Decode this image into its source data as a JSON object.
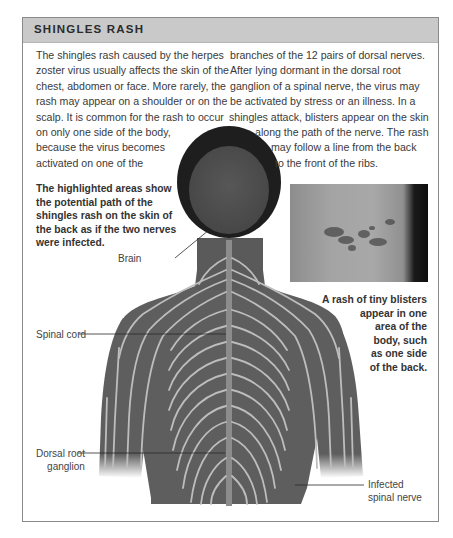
{
  "header": {
    "title": "SHINGLES RASH",
    "background_color": "#c9c9c9"
  },
  "body_text": {
    "left_lines": [
      "The shingles rash caused by the herpes",
      "zoster virus usually affects the skin of the",
      "chest, abdomen or face. More rarely, the",
      "rash may appear on a shoulder or on the",
      "scalp. It is common for the rash to occur",
      "on only one side of the body,",
      "because the virus becomes",
      "activated on one of the"
    ],
    "right_lines": [
      "branches of the 12 pairs of dorsal nerves.",
      "After lying dormant in the dorsal root",
      "ganglion of a spinal nerve, the virus may",
      "be activated by stress or an illness. In a",
      "shingles attack, blisters appear on the skin",
      "along the path of the nerve. The rash",
      "may follow a line from the back",
      "to the front of the ribs."
    ]
  },
  "note": {
    "lines": [
      "The highlighted areas show",
      "the potential path of the",
      "shingles rash on the skin of",
      "the back as if the two nerves",
      "were infected."
    ]
  },
  "photo_caption": {
    "lines": [
      "A rash of tiny blisters",
      "appear in one",
      "area of the",
      "body, such",
      "as one side",
      "of the back."
    ]
  },
  "labels": {
    "brain": "Brain",
    "spinal_cord": "Spinal cord",
    "dorsal_root_ganglion": [
      "Dorsal root",
      "ganglion"
    ],
    "infected_spinal_nerve": [
      "Infected",
      "spinal nerve"
    ]
  },
  "colors": {
    "skin": "#5e5e5e",
    "nerves": "#bdbdbd",
    "hair": "#1e1e1e",
    "brain": "#4f4f4f",
    "frame_border": "#8a8a8a"
  }
}
